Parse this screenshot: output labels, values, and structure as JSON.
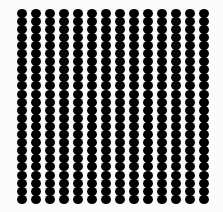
{
  "pattern": {
    "columns": 14,
    "rows": 24,
    "first_x": 22,
    "first_y": 13,
    "col_spacing": 14,
    "row_spacing": 8.1,
    "dot_color": "#000000",
    "background": "#fbfbfb"
  }
}
